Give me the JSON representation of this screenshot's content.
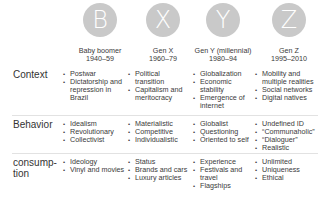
{
  "generations": [
    {
      "letter": "B",
      "name": "Baby boomer",
      "years": "1940–59"
    },
    {
      "letter": "X",
      "name": "Gen X",
      "years": "1960–79"
    },
    {
      "letter": "Y",
      "name": "Gen Y (millennial)",
      "years": "1980–94"
    },
    {
      "letter": "Z",
      "name": "Gen Z",
      "years": "1995–2010"
    }
  ],
  "rows": [
    {
      "label": "Context",
      "cells": [
        [
          "Postwar",
          "Dictatorship and repression in Brazil"
        ],
        [
          "Political transition",
          "Capitalism and meritocracy"
        ],
        [
          "Globalization",
          "Economic stability",
          "Emergence of internet"
        ],
        [
          "Mobility and multiple realities",
          "Social networks",
          "Digital natives"
        ]
      ]
    },
    {
      "label": "Behavior",
      "cells": [
        [
          "Idealism",
          "Revolutionary",
          "Collectivist"
        ],
        [
          "Materialistic",
          "Competitive",
          "Individualistic"
        ],
        [
          "Globalist",
          "Questioning",
          "Oriented to self"
        ],
        [
          "Undefined ID",
          "“Communaholic”",
          "“Dialoguer”",
          "Realistic"
        ]
      ]
    },
    {
      "label": "consump-\ntion",
      "cells": [
        [
          "Ideology",
          "Vinyl and movies"
        ],
        [
          "Status",
          "Brands and cars",
          "Luxury articles"
        ],
        [
          "Experience",
          "Festivals and travel",
          "Flagships"
        ],
        [
          "Unlimited",
          "Uniqueness",
          "Ethical"
        ]
      ]
    }
  ],
  "colors": {
    "circle": "#c9c9c9",
    "circle_text": "#ffffff",
    "divider": "#e2e2e2",
    "text": "#3a3a3a"
  }
}
